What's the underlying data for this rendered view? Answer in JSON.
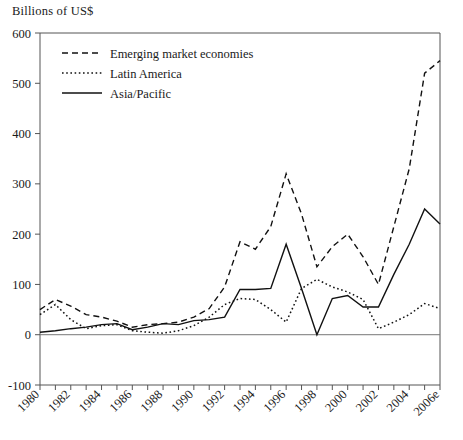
{
  "chart_data": {
    "type": "line",
    "title": "",
    "ylabel": "Billions of US$",
    "xlabel": "",
    "ylim": [
      -100,
      600
    ],
    "xlim": [
      1980,
      2006
    ],
    "grid": false,
    "legend_position": "top-left",
    "ytick_labels": [
      "600",
      "500",
      "400",
      "300",
      "200",
      "100",
      "0",
      "-100"
    ],
    "ytick_values": [
      600,
      500,
      400,
      300,
      200,
      100,
      0,
      -100
    ],
    "xtick_labels": [
      "1980",
      "1982",
      "1984",
      "1986",
      "1988",
      "1990",
      "1992",
      "1994",
      "1996",
      "1998",
      "2000",
      "2002",
      "2004",
      "2006e"
    ],
    "xtick_values": [
      1980,
      1982,
      1984,
      1986,
      1988,
      1990,
      1992,
      1994,
      1996,
      1998,
      2000,
      2002,
      2004,
      2006
    ],
    "x": [
      1980,
      1981,
      1982,
      1983,
      1984,
      1985,
      1986,
      1987,
      1988,
      1989,
      1990,
      1991,
      1992,
      1993,
      1994,
      1995,
      1996,
      1997,
      1998,
      1999,
      2000,
      2001,
      2002,
      2003,
      2004,
      2005,
      2006
    ],
    "series": [
      {
        "name": "Emerging market economies",
        "style": "dashed",
        "color": "#111111",
        "values": [
          50,
          70,
          57,
          40,
          35,
          27,
          15,
          20,
          22,
          25,
          35,
          52,
          95,
          185,
          170,
          215,
          320,
          240,
          135,
          175,
          200,
          155,
          100,
          215,
          330,
          520,
          545
        ]
      },
      {
        "name": "Latin America",
        "style": "dotted",
        "color": "#111111",
        "values": [
          40,
          60,
          30,
          12,
          18,
          20,
          8,
          5,
          3,
          8,
          18,
          35,
          60,
          72,
          70,
          50,
          25,
          92,
          110,
          95,
          85,
          70,
          12,
          25,
          40,
          62,
          52
        ]
      },
      {
        "name": "Asia/Pacific",
        "style": "solid",
        "color": "#111111",
        "values": [
          5,
          8,
          12,
          15,
          20,
          22,
          10,
          15,
          22,
          20,
          28,
          30,
          35,
          90,
          90,
          92,
          180,
          92,
          0,
          72,
          78,
          55,
          55,
          120,
          180,
          250,
          220
        ]
      }
    ]
  },
  "legend": {
    "items": [
      {
        "label": "Emerging market economies",
        "style": "dashed"
      },
      {
        "label": "Latin America",
        "style": "dotted"
      },
      {
        "label": "Asia/Pacific",
        "style": "solid"
      }
    ]
  }
}
